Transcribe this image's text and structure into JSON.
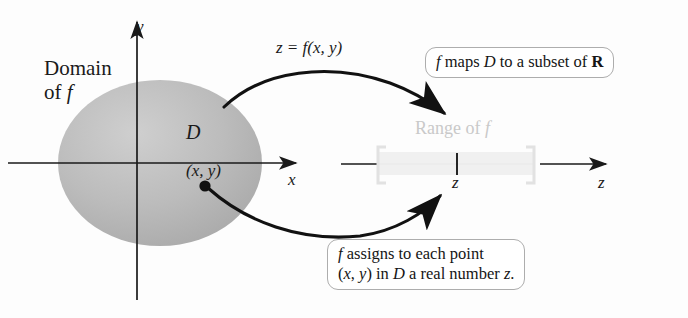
{
  "figure": {
    "background_color": "#fdfdfd",
    "ink_color": "#1a1a1a",
    "domain_fill_color": "#b3b3b3",
    "faded_color": "#c9c9c9"
  },
  "left_plane": {
    "y_axis_label": "y",
    "x_axis_label": "x",
    "domain_caption_line1": "Domain",
    "domain_caption_line2": "of f",
    "region_label": "D",
    "point_label": "(x, y)"
  },
  "mapping": {
    "equation_label": "z = f(x, y)"
  },
  "right_line": {
    "range_label": "Range of f",
    "tick_label": "z",
    "axis_label": "z"
  },
  "callouts": {
    "top": {
      "text_before": "f",
      "text_main": " maps ",
      "text_italic_d": "D",
      "text_after": " to a subset of ",
      "text_bold_r": "R"
    },
    "top_plain": "f maps D to a subset of R",
    "bottom_line1": "f assigns to each point",
    "bottom_line2": "(x, y) in D a real number z."
  }
}
